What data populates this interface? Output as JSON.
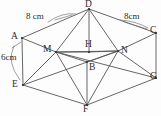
{
  "figure": {
    "kind": "geometry-diagram",
    "shape": "hexagonal-prism-pyramid",
    "stroke_color": "#555555",
    "accent_color": "#777777",
    "background_color": "#fdfdfd",
    "text_color": "#2b2b2b",
    "width": 161,
    "height": 116
  },
  "vertices": [
    {
      "id": "A",
      "label": "A",
      "x": 22,
      "y": 38,
      "label_x": 11,
      "label_y": 32
    },
    {
      "id": "D",
      "label": "D",
      "x": 89,
      "y": 9,
      "label_x": 85,
      "label_y": 0
    },
    {
      "id": "C",
      "label": "C",
      "x": 156,
      "y": 33,
      "label_x": 150,
      "label_y": 26
    },
    {
      "id": "E",
      "label": "E",
      "x": 23,
      "y": 85,
      "label_x": 12,
      "label_y": 80
    },
    {
      "id": "G",
      "label": "G",
      "x": 156,
      "y": 78,
      "label_x": 150,
      "label_y": 72
    },
    {
      "id": "F",
      "label": "F",
      "x": 87,
      "y": 105,
      "label_x": 83,
      "label_y": 105
    },
    {
      "id": "M",
      "label": "M",
      "x": 56,
      "y": 52,
      "label_x": 43,
      "label_y": 45
    },
    {
      "id": "H",
      "label": "H",
      "x": 89,
      "y": 52,
      "label_x": 85,
      "label_y": 40
    },
    {
      "id": "N",
      "label": "N",
      "x": 118,
      "y": 51,
      "label_x": 121,
      "label_y": 46
    },
    {
      "id": "B",
      "label": "B",
      "x": 87,
      "y": 62,
      "label_x": 89,
      "label_y": 63
    }
  ],
  "edges": [
    {
      "from": "A",
      "to": "D",
      "name": "edge-A-D"
    },
    {
      "from": "D",
      "to": "C",
      "name": "edge-D-C"
    },
    {
      "from": "A",
      "to": "E",
      "name": "edge-A-E"
    },
    {
      "from": "C",
      "to": "G",
      "name": "edge-C-G"
    },
    {
      "from": "E",
      "to": "F",
      "name": "edge-E-F"
    },
    {
      "from": "F",
      "to": "G",
      "name": "edge-F-G"
    },
    {
      "from": "A",
      "to": "M",
      "name": "edge-A-M"
    },
    {
      "from": "M",
      "to": "H",
      "name": "edge-M-H"
    },
    {
      "from": "H",
      "to": "N",
      "name": "edge-H-N"
    },
    {
      "from": "N",
      "to": "C",
      "name": "edge-N-C"
    },
    {
      "from": "D",
      "to": "H",
      "name": "edge-D-H"
    },
    {
      "from": "D",
      "to": "M",
      "name": "edge-D-M"
    },
    {
      "from": "D",
      "to": "N",
      "name": "edge-D-N"
    },
    {
      "from": "M",
      "to": "B",
      "name": "edge-M-B"
    },
    {
      "from": "B",
      "to": "N",
      "name": "edge-B-N"
    },
    {
      "from": "M",
      "to": "N",
      "name": "edge-M-N"
    },
    {
      "from": "B",
      "to": "F",
      "name": "edge-B-F"
    },
    {
      "from": "M",
      "to": "F",
      "name": "edge-M-F"
    },
    {
      "from": "N",
      "to": "F",
      "name": "edge-N-F"
    },
    {
      "from": "E",
      "to": "M",
      "name": "edge-E-M"
    },
    {
      "from": "N",
      "to": "G",
      "name": "edge-N-G"
    },
    {
      "from": "E",
      "to": "N",
      "name": "edge-E-N"
    },
    {
      "from": "M",
      "to": "G",
      "name": "edge-M-G"
    }
  ],
  "dimensions": [
    {
      "id": "dim-left",
      "text": "8 cm",
      "label_x": 26,
      "label_y": 12,
      "leader": {
        "x1": 55,
        "y1": 20,
        "x2": 72,
        "y2": 15
      },
      "arc": {
        "d": "M 48 22 Q 62 12 76 14"
      }
    },
    {
      "id": "dim-right",
      "text": "8cm",
      "label_x": 124,
      "label_y": 12,
      "leader": {
        "x1": 124,
        "y1": 22,
        "x2": 147,
        "y2": 29
      },
      "arc": {
        "d": "M 120 20 Q 136 21 148 28"
      }
    },
    {
      "id": "dim-side",
      "text": "6cm",
      "label_x": 1,
      "label_y": 53,
      "leader": {
        "x1": 12,
        "y1": 48,
        "x2": 21,
        "y2": 42
      },
      "arc": {
        "d": "M 14 46 Q 6 62 20 80"
      }
    }
  ]
}
